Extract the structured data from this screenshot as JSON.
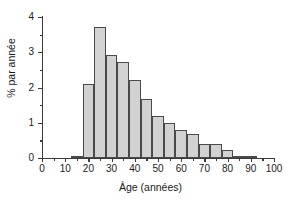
{
  "chart_data": {
    "type": "bar",
    "title": "",
    "subtitle": "",
    "xlabel": "Âge (années)",
    "ylabel": "% par année",
    "xlim": [
      0,
      100
    ],
    "ylim": [
      0,
      4
    ],
    "bin_width": 5,
    "grid": false,
    "legend": null,
    "annotations": [],
    "x_major_ticks": [
      0,
      10,
      20,
      30,
      40,
      50,
      60,
      70,
      80,
      90,
      100
    ],
    "x_minor_ticks": [
      5,
      15,
      25,
      35,
      45,
      55,
      65,
      75,
      85,
      95
    ],
    "y_major_ticks": [
      0,
      1,
      2,
      3,
      4
    ],
    "y_minor_ticks": [
      0.5,
      1.5,
      2.5,
      3.5
    ],
    "x_tick_labels": [
      "0",
      "10",
      "20",
      "30",
      "40",
      "50",
      "60",
      "70",
      "80",
      "90",
      "100"
    ],
    "y_tick_labels": [
      "0",
      "1",
      "2",
      "3",
      "4"
    ],
    "bin_edges": [
      12.5,
      17.5,
      22.5,
      27.5,
      32.5,
      37.5,
      42.5,
      47.5,
      52.5,
      57.5,
      62.5,
      67.5,
      72.5,
      77.5,
      82.5,
      87.5,
      92.5
    ],
    "categories": [
      "12.5-17.5",
      "17.5-22.5",
      "22.5-27.5",
      "27.5-32.5",
      "32.5-37.5",
      "37.5-42.5",
      "42.5-47.5",
      "47.5-52.5",
      "52.5-57.5",
      "57.5-62.5",
      "62.5-67.5",
      "67.5-72.5",
      "72.5-77.5",
      "77.5-82.5",
      "82.5-87.5",
      "87.5-92.5"
    ],
    "values": [
      0.07,
      2.09,
      3.73,
      2.91,
      2.73,
      2.2,
      1.67,
      1.2,
      0.99,
      0.8,
      0.67,
      0.39,
      0.39,
      0.24,
      0.05,
      0.05
    ],
    "bar_fill_color": "#d2d2d2",
    "bar_edge_color": "#4a4a4a",
    "axis_color": "#3a3a3a",
    "background_color": "#ffffff"
  }
}
